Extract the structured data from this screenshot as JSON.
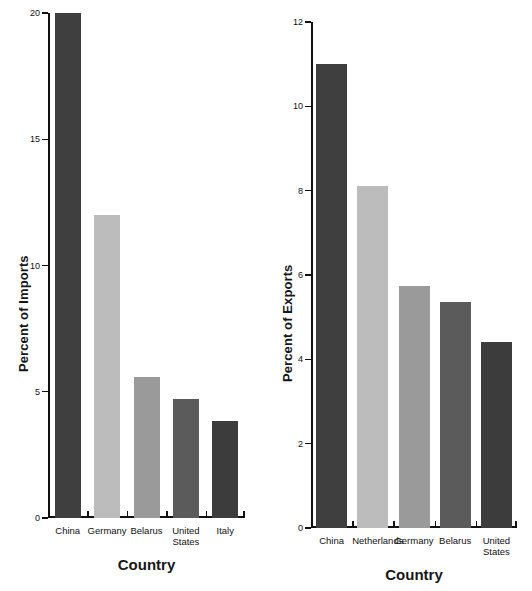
{
  "figure": {
    "background": "#ffffff",
    "panel_count": 2
  },
  "chart_data": [
    {
      "type": "bar",
      "id": "imports",
      "title": "",
      "xlabel": "Country",
      "ylabel": "Percent of Imports",
      "categories": [
        "China",
        "Germany",
        "Belarus",
        "United States",
        "Italy"
      ],
      "values": [
        20.0,
        12.0,
        5.6,
        4.7,
        3.85
      ],
      "bar_colors": [
        "#3f3f3f",
        "#bcbcbc",
        "#9a9a9a",
        "#5b5b5b",
        "#3c3c3c"
      ],
      "ylim": [
        0,
        20
      ],
      "yticks": [
        0,
        5,
        10,
        15,
        20
      ],
      "ytick_labels": [
        "0",
        "5",
        "10",
        "15",
        "20"
      ],
      "grid": false,
      "legend": "none"
    },
    {
      "type": "bar",
      "id": "exports",
      "title": "",
      "xlabel": "Country",
      "ylabel": "Percent of Exports",
      "categories": [
        "China",
        "Netherlands",
        "Germany",
        "Belarus",
        "United States"
      ],
      "values": [
        11.0,
        8.1,
        5.75,
        5.35,
        4.4
      ],
      "bar_colors": [
        "#3f3f3f",
        "#bcbcbc",
        "#9a9a9a",
        "#5b5b5b",
        "#3c3c3c"
      ],
      "ylim": [
        0,
        12
      ],
      "yticks": [
        0,
        2,
        4,
        6,
        8,
        10,
        12
      ],
      "ytick_labels": [
        "0",
        "2",
        "4",
        "6",
        "8",
        "10",
        "12"
      ],
      "grid": false,
      "legend": "none"
    }
  ]
}
